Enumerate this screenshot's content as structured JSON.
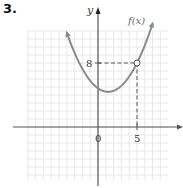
{
  "problem": {
    "number": "3."
  },
  "chart_data": {
    "type": "line",
    "title": "",
    "xlabel": "",
    "ylabel": "y",
    "curve_label": "f(x)",
    "function": "parabola opening upward, vertex approx (1.3, 4.4)",
    "vertex": [
      1.3,
      4.4
    ],
    "marked_point": {
      "x": 5,
      "y": 8,
      "style": "open-circle",
      "guides": "dashed"
    },
    "x_tick_labels": [
      {
        "value": 0,
        "label": "0"
      },
      {
        "value": 5,
        "label": "5"
      }
    ],
    "y_tick_labels": [
      {
        "value": 8,
        "label": "8"
      }
    ],
    "xlim": [
      -9,
      9
    ],
    "ylim": [
      -7,
      12
    ],
    "grid": true,
    "grid_step": 1,
    "arrows": {
      "curve_ends": true,
      "x_axis": "right",
      "y_axis": "up"
    },
    "colors": {
      "curve": "#8a8a8a",
      "axis": "#555555",
      "grid": "#e2e2e2",
      "dashed": "#555555"
    }
  }
}
